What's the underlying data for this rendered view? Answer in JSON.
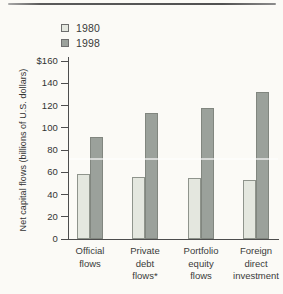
{
  "chart_data": {
    "type": "bar",
    "title": "",
    "ylabel": "Net capital flows (billions of U.S. dollars)",
    "xlabel": "",
    "ylim": [
      0,
      160
    ],
    "ytick_values": [
      160,
      140,
      120,
      100,
      80,
      60,
      40,
      20,
      0
    ],
    "ytick_labels": [
      "$160",
      "140",
      "120",
      "100",
      "80",
      "60",
      "40",
      "20",
      "0"
    ],
    "categories": [
      "Official flows",
      "Private debt flows*",
      "Portfolio equity flows",
      "Foreign direct investment"
    ],
    "xtick_lines": [
      [
        "Official",
        "flows"
      ],
      [
        "Private",
        "debt",
        "flows*"
      ],
      [
        "Portfolio",
        "equity",
        "flows"
      ],
      [
        "Foreign",
        "direct",
        "investment"
      ]
    ],
    "series": [
      {
        "name": "1980",
        "values": [
          58,
          56,
          55,
          53
        ],
        "color": "#e4e7df",
        "border_color": "#8f948c"
      },
      {
        "name": "1998",
        "values": [
          92,
          113,
          118,
          132
        ],
        "color": "#9ba19b",
        "border_color": "#81867f"
      }
    ],
    "grid": false,
    "legend_position": "top-left"
  }
}
